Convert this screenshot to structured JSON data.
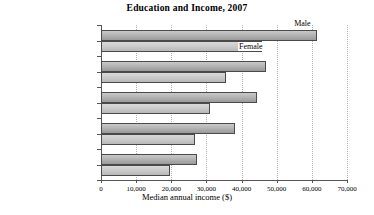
{
  "chart_data": {
    "type": "bar",
    "orientation": "horizontal",
    "title": "Education and Income, 2007",
    "xlabel": "Median annual income ($)",
    "ylabel": "",
    "xlim": [
      0,
      70000
    ],
    "xticks": [
      0,
      10000,
      20000,
      30000,
      40000,
      50000,
      60000,
      70000
    ],
    "xticklabels": [
      "0",
      "10,000",
      "20,000",
      "30,000",
      "40,000",
      "50,000",
      "60,000",
      "70,000"
    ],
    "grid": "vertical-dotted",
    "legend_position": "inline-annotations",
    "categories": [
      "Bachelor's degree",
      "Associate degree",
      "Some college",
      "High school diploma",
      "Some high school"
    ],
    "series": [
      {
        "name": "Male",
        "color": "#b4b4b4",
        "values": [
          61500,
          47000,
          44400,
          38100,
          27300
        ]
      },
      {
        "name": "Female",
        "color": "#cccccc",
        "values": [
          45800,
          35600,
          31000,
          26700,
          19600
        ]
      }
    ],
    "annotations": [
      {
        "text": "Male",
        "series": "Male",
        "category": "Bachelor's degree"
      },
      {
        "text": "Female",
        "series": "Female",
        "category": "Bachelor's degree"
      }
    ]
  }
}
